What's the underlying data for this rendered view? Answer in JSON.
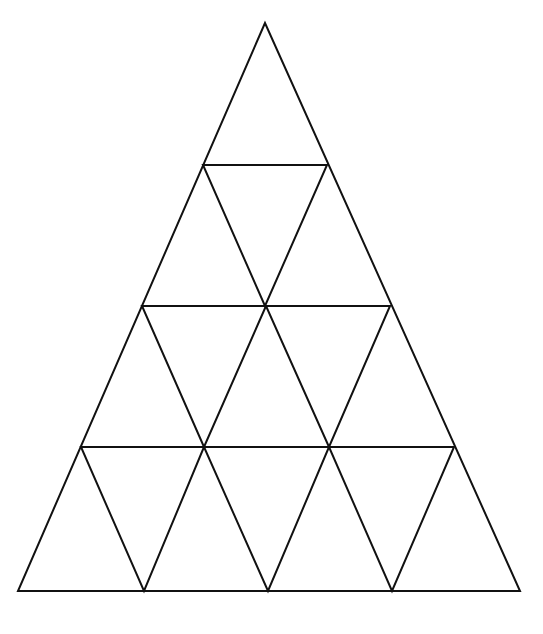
{
  "diagram": {
    "stroke_color": "#111111",
    "background": "#ffffff",
    "stroke_width": 2,
    "outer_triangle": [
      [
        265,
        23
      ],
      [
        18,
        591
      ],
      [
        520,
        591
      ]
    ],
    "horizontal_lines": [
      [
        [
          203,
          165
        ],
        [
          327,
          165
        ]
      ],
      [
        [
          142,
          306
        ],
        [
          390,
          306
        ]
      ],
      [
        [
          81,
          447
        ],
        [
          454,
          447
        ]
      ]
    ],
    "inverted_triangles": [
      [
        [
          203,
          165
        ],
        [
          327,
          165
        ],
        [
          265,
          306
        ]
      ],
      [
        [
          142,
          306
        ],
        [
          266,
          306
        ],
        [
          204,
          447
        ]
      ],
      [
        [
          266,
          306
        ],
        [
          390,
          306
        ],
        [
          329,
          447
        ]
      ],
      [
        [
          81,
          447
        ],
        [
          204,
          447
        ],
        [
          144,
          591
        ]
      ],
      [
        [
          204,
          447
        ],
        [
          329,
          447
        ],
        [
          268,
          591
        ]
      ],
      [
        [
          329,
          447
        ],
        [
          454,
          447
        ],
        [
          392,
          591
        ]
      ]
    ],
    "rows": 4,
    "small_triangle_count": 16
  }
}
